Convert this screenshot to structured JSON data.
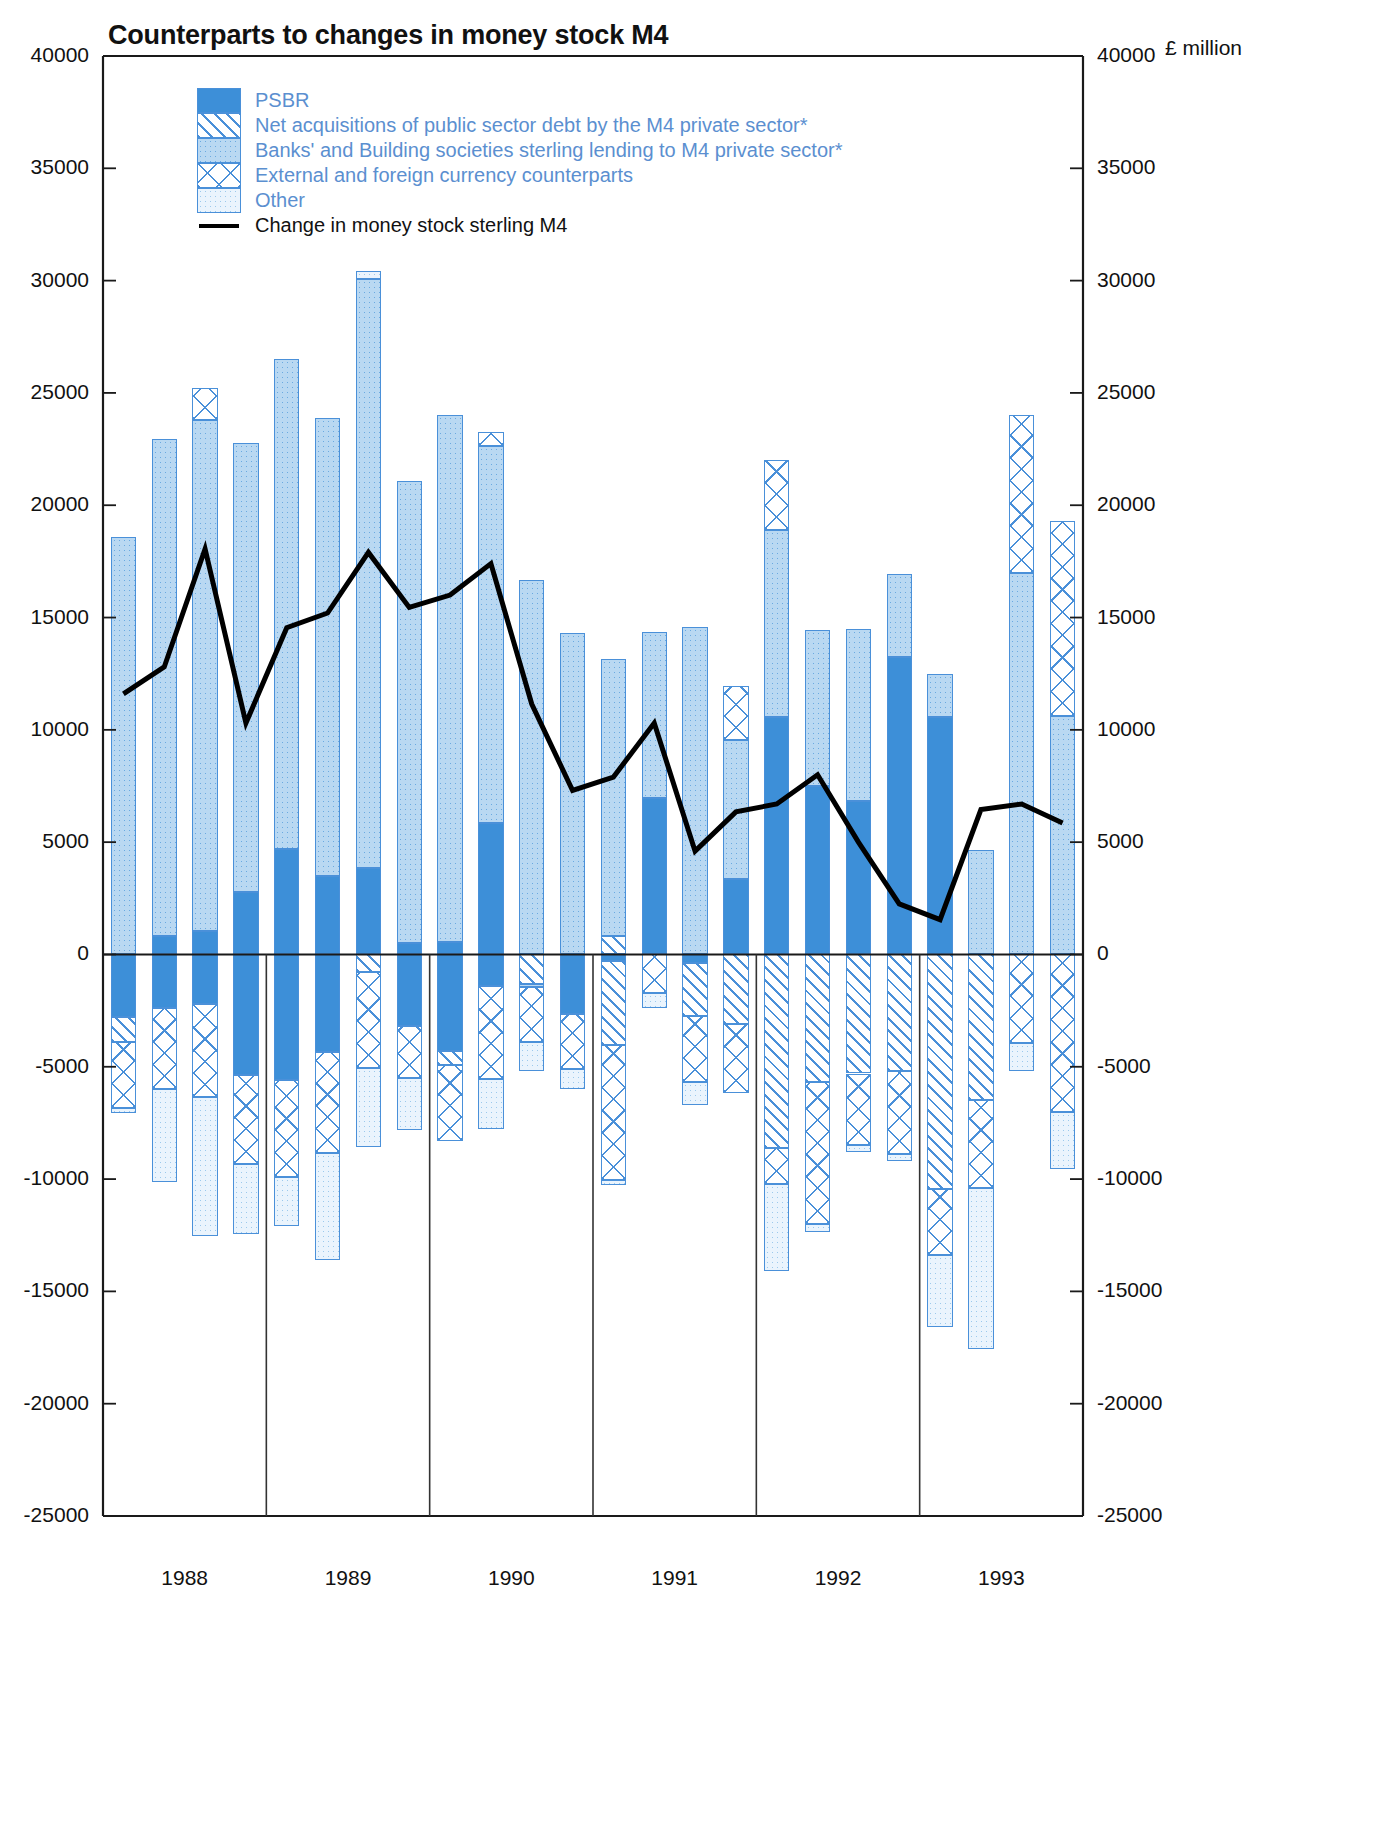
{
  "header": {
    "title": "Counterparts to changes in money stock M4",
    "unit": "£ million"
  },
  "legend": {
    "items": [
      {
        "key": "psbr",
        "label": "PSBR",
        "pattern": "solid-blue",
        "color": "#3d8fd8"
      },
      {
        "key": "net_acq",
        "label": "Net acquisitions of public sector debt by the M4 private sector*",
        "pattern": "diagonal-hatch",
        "color": "#4a90d9"
      },
      {
        "key": "lending",
        "label": "Banks' and Building societies sterling lending to M4 private sector*",
        "pattern": "dotted-blue",
        "color": "#b9d8f2"
      },
      {
        "key": "external",
        "label": "External and foreign currency counterparts",
        "pattern": "cross-hatch",
        "color": "#4a90d9"
      },
      {
        "key": "other",
        "label": "Other",
        "pattern": "light-stipple",
        "color": "#eaf4fd"
      }
    ],
    "line_item": {
      "key": "m4_change",
      "label": "Change in money stock sterling M4",
      "color": "#000000"
    }
  },
  "chart_data": {
    "type": "bar",
    "subtype": "stacked-bar-with-line",
    "title": "Counterparts to changes in money stock M4",
    "xlabel": "",
    "ylabel": "£ million",
    "ylim": [
      -25000,
      40000
    ],
    "yticks": [
      -25000,
      -20000,
      -15000,
      -10000,
      -5000,
      0,
      5000,
      10000,
      15000,
      20000,
      25000,
      30000,
      35000,
      40000
    ],
    "ytick_labels": [
      "-25000",
      "-20000",
      "-15000",
      "-10000",
      "-5000",
      "0",
      "5000",
      "10000",
      "15000",
      "20000",
      "25000",
      "30000",
      "35000",
      "40000"
    ],
    "grid": false,
    "legend_position": "top-left",
    "axis_right_mirrored": true,
    "year_labels": [
      "1988",
      "1989",
      "1990",
      "1991",
      "1992",
      "1993"
    ],
    "periods_per_year": 4,
    "x": [
      "1988 Q1",
      "1988 Q2",
      "1988 Q3",
      "1988 Q4",
      "1989 Q1",
      "1989 Q2",
      "1989 Q3",
      "1989 Q4",
      "1990 Q1",
      "1990 Q2",
      "1990 Q3",
      "1990 Q4",
      "1991 Q1",
      "1991 Q2",
      "1991 Q3",
      "1991 Q4",
      "1992 Q1",
      "1992 Q2",
      "1992 Q3",
      "1992 Q4",
      "1993 Q1",
      "1993 Q2",
      "1993 Q3",
      "1993 Q4"
    ],
    "series": [
      {
        "name": "PSBR",
        "key": "psbr",
        "values": [
          0,
          800,
          1050,
          2800,
          4700,
          3500,
          3850,
          500,
          550,
          5850,
          0,
          0,
          0,
          6950,
          0,
          3350,
          10550,
          7500,
          6850,
          13250,
          10550,
          0,
          0,
          0
        ]
      },
      {
        "name": "Net acquisitions of public sector debt by the M4 private sector*",
        "key": "net_acq",
        "values": [
          0,
          0,
          0,
          0,
          0,
          0,
          0,
          0,
          0,
          0,
          0,
          0,
          800,
          0,
          0,
          0,
          0,
          0,
          0,
          0,
          0,
          0,
          0,
          0
        ]
      },
      {
        "name": "Banks' and Building societies sterling lending to M4 private sector*",
        "key": "lending",
        "values": [
          18600,
          22150,
          22750,
          19950,
          21800,
          20400,
          26200,
          20600,
          23450,
          16800,
          16650,
          14300,
          12350,
          7400,
          14600,
          6200,
          8350,
          6950,
          7650,
          3700,
          1950,
          4650,
          17000,
          10600
        ]
      },
      {
        "name": "External and foreign currency counterparts",
        "key": "external",
        "values": [
          0,
          0,
          1400,
          0,
          0,
          0,
          0,
          0,
          0,
          600,
          0,
          0,
          0,
          0,
          0,
          2400,
          3100,
          0,
          0,
          0,
          0,
          0,
          7000,
          8700
        ]
      },
      {
        "name": "Other",
        "key": "other",
        "values": [
          0,
          0,
          0,
          0,
          0,
          0,
          400,
          0,
          0,
          0,
          0,
          0,
          0,
          0,
          0,
          0,
          0,
          0,
          0,
          0,
          0,
          0,
          0,
          0
        ]
      }
    ],
    "negative_series": [
      {
        "name": "PSBR",
        "key": "psbr",
        "values": [
          -2800,
          -2400,
          -2200,
          -5350,
          -5600,
          -4350,
          0,
          -3200,
          -4300,
          -1400,
          0,
          -2650,
          -300,
          0,
          -400,
          0,
          0,
          0,
          0,
          0,
          0,
          0,
          0,
          0
        ]
      },
      {
        "name": "Net acquisitions of public sector debt by the M4 private sector*",
        "key": "net_acq",
        "values": [
          -1100,
          0,
          0,
          0,
          0,
          0,
          -800,
          0,
          -600,
          0,
          -1300,
          0,
          -3750,
          0,
          -2350,
          -3100,
          -8600,
          -5700,
          -5300,
          -5200,
          -10450,
          -6500,
          0,
          0
        ]
      },
      {
        "name": "Banks' and Building societies sterling lending to M4 private sector*",
        "key": "lending",
        "values": [
          0,
          0,
          0,
          0,
          0,
          0,
          0,
          0,
          0,
          0,
          -150,
          0,
          0,
          0,
          0,
          0,
          0,
          0,
          0,
          0,
          0,
          0,
          0,
          0
        ]
      },
      {
        "name": "External and foreign currency counterparts",
        "key": "external",
        "values": [
          -2950,
          -3600,
          -4150,
          -4000,
          -4300,
          -4500,
          -4250,
          -2300,
          -3400,
          -4150,
          -2450,
          -2450,
          -6000,
          -1700,
          -2950,
          -3050,
          -1600,
          -6300,
          -3200,
          -3700,
          -2950,
          -3900,
          -3950,
          -7000
        ]
      },
      {
        "name": "Other",
        "key": "other",
        "values": [
          -200,
          -4150,
          -6200,
          -3100,
          -2200,
          -4750,
          -3500,
          -2300,
          0,
          -2200,
          -1300,
          -900,
          -200,
          -700,
          -1000,
          0,
          -3900,
          -350,
          -300,
          -300,
          -3200,
          -7150,
          -1250,
          -2550
        ]
      }
    ],
    "line_series": {
      "name": "Change in money stock sterling M4",
      "key": "m4_change",
      "values": [
        11600,
        12800,
        18050,
        10300,
        14550,
        15200,
        17900,
        15450,
        16000,
        17400,
        11150,
        7300,
        7900,
        10300,
        4600,
        6350,
        6700,
        8000,
        5000,
        2250,
        1550,
        6450,
        6700,
        5850
      ]
    }
  }
}
